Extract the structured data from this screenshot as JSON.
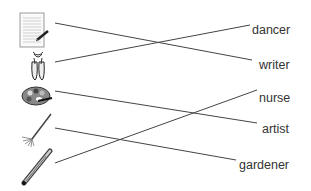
{
  "exercise": {
    "pictures": [
      {
        "id": "writing-paper",
        "name": "writing paper with pen"
      },
      {
        "id": "ballet-shoes",
        "name": "ballet shoes"
      },
      {
        "id": "paint-palette",
        "name": "paint palette"
      },
      {
        "id": "rake",
        "name": "rake"
      },
      {
        "id": "thermometer",
        "name": "thermometer"
      }
    ],
    "words": [
      {
        "label": "dancer"
      },
      {
        "label": "writer"
      },
      {
        "label": "nurse"
      },
      {
        "label": "artist"
      },
      {
        "label": "gardener"
      }
    ],
    "matches": [
      {
        "picture": "writing paper",
        "word": "writer"
      },
      {
        "picture": "ballet shoes",
        "word": "dancer"
      },
      {
        "picture": "paint palette",
        "word": "artist"
      },
      {
        "picture": "rake",
        "word": "gardener"
      },
      {
        "picture": "thermometer",
        "word": "nurse"
      }
    ],
    "line_color": "#444444"
  }
}
